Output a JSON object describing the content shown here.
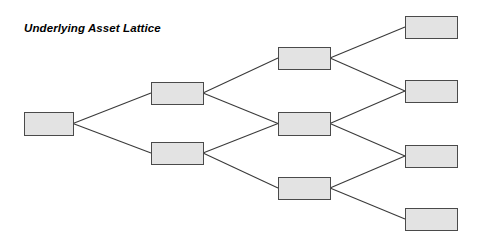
{
  "figure": {
    "title": "Underlying Asset Lattice",
    "background_color": "#ffffff",
    "node_fill_color": "#e3e3e3",
    "node_stroke_color": "#4a4a4a",
    "edge_color": "#3a3a3a",
    "title_color": "#000000"
  },
  "chart_data": {
    "type": "diagram",
    "diagram_type": "recombining-binomial-lattice",
    "title": "Underlying Asset Lattice",
    "steps": 4,
    "xlabel": "",
    "ylabel": "",
    "grid": false,
    "legend": null,
    "nodes": [
      {
        "id": "n0_0",
        "step": 0,
        "level": 0,
        "label": "",
        "x": 24,
        "y": 112,
        "w": 49,
        "h": 23
      },
      {
        "id": "n1_0",
        "step": 1,
        "level": 0,
        "label": "",
        "x": 151,
        "y": 82,
        "w": 52,
        "h": 22
      },
      {
        "id": "n1_1",
        "step": 1,
        "level": 1,
        "label": "",
        "x": 151,
        "y": 142,
        "w": 52,
        "h": 22
      },
      {
        "id": "n2_0",
        "step": 2,
        "level": 0,
        "label": "",
        "x": 278,
        "y": 47,
        "w": 52,
        "h": 22
      },
      {
        "id": "n2_1",
        "step": 2,
        "level": 1,
        "label": "",
        "x": 278,
        "y": 112,
        "w": 52,
        "h": 23
      },
      {
        "id": "n2_2",
        "step": 2,
        "level": 2,
        "label": "",
        "x": 278,
        "y": 177,
        "w": 52,
        "h": 22
      },
      {
        "id": "n3_0",
        "step": 3,
        "level": 0,
        "label": "",
        "x": 405,
        "y": 16,
        "w": 52,
        "h": 22
      },
      {
        "id": "n3_1",
        "step": 3,
        "level": 1,
        "label": "",
        "x": 405,
        "y": 80,
        "w": 52,
        "h": 22
      },
      {
        "id": "n3_2",
        "step": 3,
        "level": 2,
        "label": "",
        "x": 405,
        "y": 145,
        "w": 52,
        "h": 22
      },
      {
        "id": "n3_3",
        "step": 3,
        "level": 3,
        "label": "",
        "x": 405,
        "y": 208,
        "w": 52,
        "h": 22
      }
    ],
    "edges": [
      {
        "from": "n0_0",
        "to": "n1_0",
        "direction": "up"
      },
      {
        "from": "n0_0",
        "to": "n1_1",
        "direction": "down"
      },
      {
        "from": "n1_0",
        "to": "n2_0",
        "direction": "up"
      },
      {
        "from": "n1_0",
        "to": "n2_1",
        "direction": "down"
      },
      {
        "from": "n1_1",
        "to": "n2_1",
        "direction": "up"
      },
      {
        "from": "n1_1",
        "to": "n2_2",
        "direction": "down"
      },
      {
        "from": "n2_0",
        "to": "n3_0",
        "direction": "up"
      },
      {
        "from": "n2_0",
        "to": "n3_1",
        "direction": "down"
      },
      {
        "from": "n2_1",
        "to": "n3_1",
        "direction": "up"
      },
      {
        "from": "n2_1",
        "to": "n3_2",
        "direction": "down"
      },
      {
        "from": "n2_2",
        "to": "n3_2",
        "direction": "up"
      },
      {
        "from": "n2_2",
        "to": "n3_3",
        "direction": "down"
      }
    ]
  }
}
